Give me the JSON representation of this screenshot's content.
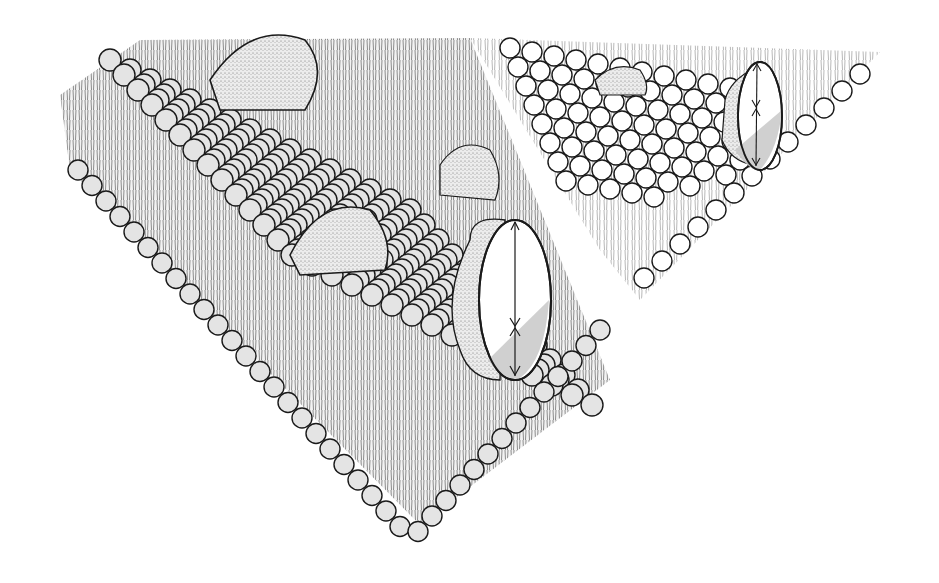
{
  "diagram": {
    "labels": [],
    "colors": {
      "background": "#ffffff",
      "outline": "#1a1a1a",
      "head_fill_front": "#e4e4e4",
      "head_fill_back": "#ffffff",
      "tail_stroke": "#3a3a3a",
      "protein_stipple": "#d8d8d8",
      "cut_shade": "#c8c8c8"
    },
    "parts": [
      {
        "id": "front-bilayer-block",
        "kind": "lipid bilayer slab (shaded heads)"
      },
      {
        "id": "back-bilayer-block",
        "kind": "lipid bilayer slab (white heads)"
      },
      {
        "id": "peripheral-protein-top",
        "kind": "protein dome"
      },
      {
        "id": "peripheral-protein-middle",
        "kind": "protein dome"
      },
      {
        "id": "peripheral-protein-lower",
        "kind": "protein dome"
      },
      {
        "id": "peripheral-protein-back",
        "kind": "protein dome"
      },
      {
        "id": "transmembrane-protein-front",
        "kind": "cut-away integral protein with span arrows"
      },
      {
        "id": "transmembrane-protein-back",
        "kind": "cut-away integral protein with span arrows"
      }
    ]
  }
}
